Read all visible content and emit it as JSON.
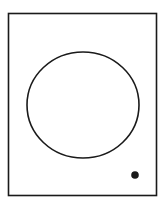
{
  "diagram": {
    "background": "#ffffff",
    "stroke_color": "#1a1a1a",
    "frame": {
      "x": 8.5,
      "y": 13.5,
      "width": 148,
      "height": 182,
      "stroke_width": 1.6
    },
    "circle": {
      "cx": 83,
      "cy": 105,
      "rx": 56,
      "ry": 53,
      "stroke_width": 1.6
    },
    "dot": {
      "cx": 135,
      "cy": 175,
      "r": 3.8
    }
  }
}
